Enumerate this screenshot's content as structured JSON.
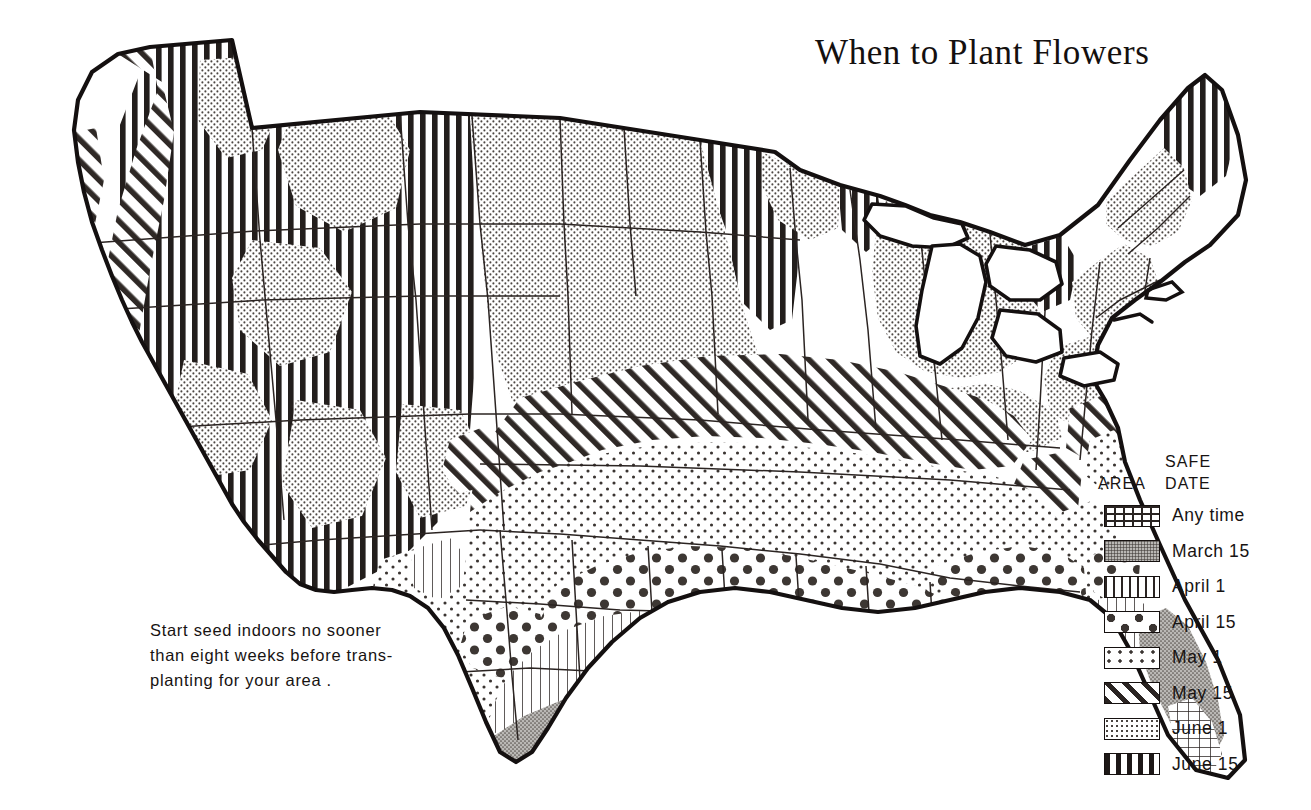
{
  "title": "When to Plant Flowers",
  "note": {
    "line1": "Start seed indoors no sooner",
    "line2": "than eight weeks before trans-",
    "line3": "planting for your area ."
  },
  "legend": {
    "header_area": "AREA",
    "header_safe": "SAFE",
    "header_date": "DATE",
    "rows": [
      {
        "pattern": "grid",
        "label": "Any time"
      },
      {
        "pattern": "stipple-dense-gray",
        "label": "March 15"
      },
      {
        "pattern": "vertical-thin",
        "label": "April 1"
      },
      {
        "pattern": "large-dots",
        "label": "April 15"
      },
      {
        "pattern": "sparse-dots",
        "label": "May 1"
      },
      {
        "pattern": "diagonal-stripes",
        "label": "May 15"
      },
      {
        "pattern": "stipple-medium",
        "label": "June 1"
      },
      {
        "pattern": "vertical-bold",
        "label": "June 15"
      }
    ]
  },
  "map": {
    "name": "united-states-planting-zones-map",
    "outline_color": "#141010",
    "state_border_color": "#2b2422",
    "background": "#ffffff",
    "zones": [
      {
        "zone": "Any time",
        "pattern": "grid",
        "regions": "southern tip of Florida; extreme southern coastal California"
      },
      {
        "zone": "March 15",
        "pattern": "stipple-dense-gray",
        "regions": "south Texas and Gulf coast strip; Florida peninsula; southern California / lower desert"
      },
      {
        "zone": "April 1",
        "pattern": "vertical-thin",
        "regions": "Gulf coast states inland band: east Texas, Louisiana, Mississippi, Alabama, Georgia, north Florida; central California valleys"
      },
      {
        "zone": "April 15",
        "pattern": "large-dots",
        "regions": "band across north Texas, Oklahoma, Arkansas, Tennessee, northern Alabama/Georgia, the Carolinas"
      },
      {
        "zone": "May 1",
        "pattern": "sparse-dots",
        "regions": "central plains and mid-south: Kansas, Missouri, Kentucky, Virginia, mid-Atlantic coast, New Jersey, Delaware, Long Island, southern New England coast"
      },
      {
        "zone": "May 15",
        "pattern": "diagonal-stripes",
        "regions": "diagonal belt from Colorado/Nebraska across Iowa, Illinois, Indiana, Ohio, West Virginia to Pennsylvania; Pacific northwest coastal strip; scattered western valleys"
      },
      {
        "zone": "June 1",
        "pattern": "stipple-medium",
        "regions": "northern plains: Montana, Dakotas, Nebraska, Minnesota, Wisconsin, Michigan, New York, Vermont, New Hampshire, Maine coast; Great Basin patches"
      },
      {
        "zone": "June 15",
        "pattern": "vertical-bold",
        "regions": "Rocky Mountain high country, Idaho, Wyoming, northern Utah/Nevada; far-northern Minnesota; Michigan upper peninsula; northern Maine"
      }
    ]
  }
}
